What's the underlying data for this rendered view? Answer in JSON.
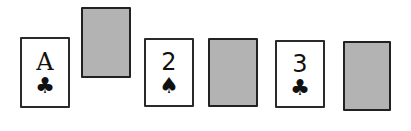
{
  "board": {
    "background": "#ffffff",
    "card_back_color": "#b3b3b3",
    "cards": [
      {
        "type": "face",
        "rank": "A",
        "suit": "clubs",
        "suit_glyph": "♣"
      },
      {
        "type": "back"
      },
      {
        "type": "face",
        "rank": "2",
        "suit": "spades",
        "suit_glyph": "♠"
      },
      {
        "type": "back"
      },
      {
        "type": "face",
        "rank": "3",
        "suit": "clubs",
        "suit_glyph": "♣"
      },
      {
        "type": "back"
      }
    ]
  }
}
